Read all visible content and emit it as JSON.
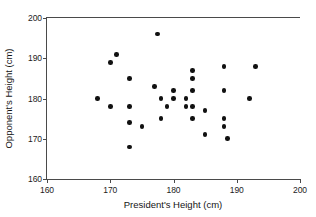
{
  "chart_data": {
    "type": "scatter",
    "title": "",
    "xlabel": "President's Height (cm)",
    "ylabel": "Opponent's Height (cm)",
    "xlim": [
      160,
      200
    ],
    "ylim": [
      160,
      200
    ],
    "xticks": [
      160,
      170,
      180,
      190,
      200
    ],
    "yticks": [
      160,
      170,
      180,
      190,
      200
    ],
    "xtick_labels": [
      "160",
      "170",
      "180",
      "190",
      "200"
    ],
    "ytick_labels": [
      "160",
      "170",
      "180",
      "190",
      "200"
    ],
    "grid": false,
    "legend": null,
    "marker": "filled-circle",
    "marker_color": "#111111",
    "n_points": 40,
    "x": [
      177.5,
      171.0,
      170.0,
      173.0,
      168.0,
      177.0,
      183.0,
      183.0,
      188.0,
      193.0,
      170.0,
      173.0,
      178.0,
      180.0,
      182.0,
      183.0,
      188.0,
      192.0,
      179.0,
      182.0,
      183.0,
      188.0,
      185.0,
      178.0,
      183.0,
      188.0,
      175.0,
      173.0,
      185.0,
      188.5,
      173.0,
      180.0,
      182.0,
      180.0,
      183.0,
      190.0,
      178.5,
      182.5,
      187.5,
      184.0
    ],
    "y": [
      196.0,
      191.0,
      189.0,
      185.0,
      180.0,
      183.0,
      187.0,
      185.0,
      188.0,
      188.0,
      178.0,
      178.0,
      180.0,
      182.0,
      182.0,
      182.0,
      182.0,
      180.0,
      178.0,
      178.0,
      178.0,
      175.0,
      177.0,
      175.0,
      175.0,
      173.0,
      173.0,
      174.0,
      171.0,
      170.0,
      168.0,
      180.0,
      180.0,
      180.0,
      180.0,
      180.0,
      178.0,
      180.0,
      177.0,
      180.0
    ],
    "points": [
      {
        "x": 177.5,
        "y": 196.0
      },
      {
        "x": 171.0,
        "y": 191.0
      },
      {
        "x": 170.0,
        "y": 189.0
      },
      {
        "x": 173.0,
        "y": 185.0
      },
      {
        "x": 168.0,
        "y": 180.0
      },
      {
        "x": 177.0,
        "y": 183.0
      },
      {
        "x": 183.0,
        "y": 187.0
      },
      {
        "x": 183.0,
        "y": 185.0
      },
      {
        "x": 188.0,
        "y": 188.0
      },
      {
        "x": 193.0,
        "y": 188.0
      },
      {
        "x": 170.0,
        "y": 178.0
      },
      {
        "x": 173.0,
        "y": 178.0
      },
      {
        "x": 178.0,
        "y": 180.0
      },
      {
        "x": 180.0,
        "y": 180.0
      },
      {
        "x": 182.0,
        "y": 180.0
      },
      {
        "x": 180.0,
        "y": 182.0
      },
      {
        "x": 183.0,
        "y": 182.0
      },
      {
        "x": 188.0,
        "y": 182.0
      },
      {
        "x": 192.0,
        "y": 180.0
      },
      {
        "x": 179.0,
        "y": 178.0
      },
      {
        "x": 182.0,
        "y": 178.0
      },
      {
        "x": 183.0,
        "y": 178.0
      },
      {
        "x": 185.0,
        "y": 177.0
      },
      {
        "x": 178.0,
        "y": 175.0
      },
      {
        "x": 183.0,
        "y": 175.0
      },
      {
        "x": 188.0,
        "y": 175.0
      },
      {
        "x": 175.0,
        "y": 173.0
      },
      {
        "x": 188.0,
        "y": 173.0
      },
      {
        "x": 173.0,
        "y": 174.0
      },
      {
        "x": 185.0,
        "y": 171.0
      },
      {
        "x": 188.5,
        "y": 170.0
      },
      {
        "x": 173.0,
        "y": 168.0
      }
    ]
  }
}
